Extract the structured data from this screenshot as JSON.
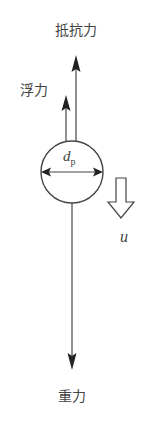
{
  "diagram": {
    "title": "",
    "particle": {
      "diameter_symbol": "d",
      "diameter_subscript": "p"
    },
    "forces": {
      "drag_label": "抵抗力",
      "buoyancy_label": "浮力",
      "gravity_label": "重力"
    },
    "velocity": {
      "symbol": "u",
      "direction": "down"
    },
    "colors": {
      "stroke": "#444444",
      "fill": "#ffffff"
    }
  }
}
